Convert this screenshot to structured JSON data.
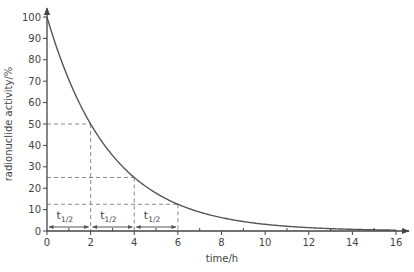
{
  "chart_data": {
    "type": "line",
    "title": "",
    "xlabel": "time/h",
    "ylabel": "radionuclide activity/%",
    "xlim": [
      0,
      16
    ],
    "ylim": [
      0,
      100
    ],
    "x_ticks": [
      0,
      2,
      4,
      6,
      8,
      10,
      12,
      14,
      16
    ],
    "x_minor_ticks": [
      1,
      3,
      5,
      7,
      9,
      11,
      13,
      15
    ],
    "y_ticks": [
      0,
      10,
      20,
      30,
      40,
      50,
      60,
      70,
      80,
      90,
      100
    ],
    "grid": false,
    "legend": null,
    "series": [
      {
        "name": "activity",
        "x": [
          0,
          1,
          2,
          3,
          4,
          5,
          6,
          7,
          8,
          9,
          10,
          11,
          12,
          13,
          14,
          15,
          16
        ],
        "values": [
          100,
          70.7,
          50,
          35.4,
          25,
          17.7,
          12.5,
          8.8,
          6.25,
          4.4,
          3.1,
          2.2,
          1.6,
          1.1,
          0.8,
          0.6,
          0.4
        ],
        "color": "#555555"
      }
    ],
    "half_life_hours": 2,
    "reference_lines": [
      {
        "x": 2,
        "y": 50
      },
      {
        "x": 4,
        "y": 25
      },
      {
        "x": 6,
        "y": 12.5
      }
    ],
    "annotations": [
      {
        "text": "t",
        "subscript": "1/2",
        "x_from": 0,
        "x_to": 2
      },
      {
        "text": "t",
        "subscript": "1/2",
        "x_from": 2,
        "x_to": 4
      },
      {
        "text": "t",
        "subscript": "1/2",
        "x_from": 4,
        "x_to": 6
      }
    ]
  },
  "colors": {
    "axis": "#444444",
    "curve": "#555555",
    "dashed": "#8a8a8a"
  }
}
